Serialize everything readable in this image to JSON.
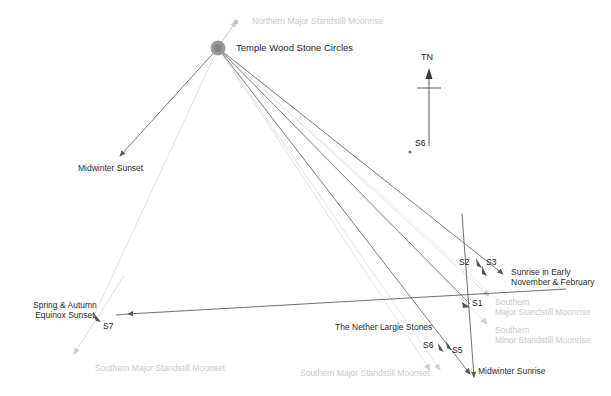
{
  "diagram": {
    "background_color": "#ffffff",
    "width": 611,
    "height": 396,
    "colors": {
      "ray_dark": "#6b6b6b",
      "ray_mid": "#8f8f8f",
      "ray_faint": "#dedede",
      "text_dark": "#2b2b2b",
      "text_faint": "#c9c9c9",
      "marker": "#8c8c8c"
    }
  },
  "origin": {
    "name": "Temple Wood Stone Circles",
    "label": "Temple Wood Stone Circles",
    "x": 218,
    "y": 48,
    "marker": "filled-circle"
  },
  "north_indicator": {
    "label": "TN",
    "x": 428,
    "y": 58,
    "shaft_top": 72,
    "shaft_bottom": 145,
    "crossbar_y": 88
  },
  "labels": [
    {
      "id": "northern-major-standstill-moonrise",
      "text": "Northern Major Standstill Moonrise",
      "x": 252,
      "y": 22,
      "tone": "faint",
      "align": "left"
    },
    {
      "id": "temple-wood-stone-circles",
      "text": "Temple Wood Stone Circles",
      "x": 236,
      "y": 43,
      "tone": "stone",
      "align": "left"
    },
    {
      "id": "midwinter-sunset",
      "text": "Midwinter Sunset",
      "x": 78,
      "y": 163,
      "tone": "dark",
      "align": "left"
    },
    {
      "id": "spring-autumn-equinox-sunset",
      "text": "Spring & Autumn\nEquinox Sunset",
      "x": 33,
      "y": 302,
      "tone": "dark",
      "align": "left"
    },
    {
      "id": "the-nether-largie-stones",
      "text": "The Nether Largie Stones",
      "x": 335,
      "y": 325,
      "tone": "dark",
      "align": "left"
    },
    {
      "id": "sunrise-early-november-february",
      "text": "Sunrise in Early\nNovember & February",
      "x": 511,
      "y": 269,
      "tone": "dark",
      "align": "left"
    },
    {
      "id": "southern-major-standstill-moonrise",
      "text": "Southern\nMajor Standstill Moonrise",
      "x": 491,
      "y": 299,
      "tone": "faint",
      "align": "left"
    },
    {
      "id": "southern-minor-standstill-moonrise",
      "text": "Southern\nMinor Standstill Moonrise",
      "x": 491,
      "y": 326,
      "tone": "faint",
      "align": "left"
    },
    {
      "id": "midwinter-sunrise",
      "text": "Midwinter Sunrise",
      "x": 478,
      "y": 367,
      "tone": "dark",
      "align": "left"
    },
    {
      "id": "southern-major-standstill-moonset-left",
      "text": "Southern Major Standstill Moonset",
      "x": 95,
      "y": 364,
      "tone": "faint",
      "align": "left"
    },
    {
      "id": "southern-major-standstill-moonset-mid",
      "text": "Southern Major Standstill Moonset",
      "x": 300,
      "y": 369,
      "tone": "faint",
      "align": "left"
    }
  ],
  "stone_markers": [
    {
      "id": "S7",
      "label": "S7",
      "label_x": 103,
      "label_y": 325,
      "dot_x": 97,
      "dot_y": 317
    },
    {
      "id": "S1",
      "label": "S1",
      "label_x": 472,
      "label_y": 300,
      "dot_x": 466,
      "dot_y": 305
    },
    {
      "id": "S2",
      "label": "S2",
      "label_x": 461,
      "label_y": 260,
      "dot_x": 478,
      "dot_y": 261
    },
    {
      "id": "S3",
      "label": "S3",
      "label_x": 486,
      "label_y": 260,
      "dot_x": 483,
      "dot_y": 268
    },
    {
      "id": "S5",
      "label": "S5",
      "label_x": 452,
      "label_y": 347,
      "dot_x": 447,
      "dot_y": 344
    },
    {
      "id": "S6-bottom",
      "label": "S6",
      "label_x": 425,
      "label_y": 342,
      "dot_x": 440,
      "dot_y": 346
    },
    {
      "id": "S6-north",
      "label": "S6",
      "label_x": 417,
      "label_y": 139,
      "dot_x": 411,
      "dot_y": 151
    }
  ],
  "rays": [
    {
      "id": "ray-midwinter-sunset",
      "from": "origin",
      "to_x": 118,
      "to_y": 158,
      "tone": "dark",
      "arrow": true
    },
    {
      "id": "ray-equinox-sunset-via-s7",
      "from": "origin",
      "to_x": 88,
      "to_y": 330,
      "tone": "faint",
      "arrow": true
    },
    {
      "id": "ray-s1-axis",
      "from": "origin",
      "to_x": 472,
      "to_y": 307,
      "tone": "dark",
      "arrow": true
    },
    {
      "id": "ray-sunrise-nov-feb",
      "from": "origin",
      "to_x": 504,
      "to_y": 276,
      "tone": "dark",
      "arrow": true
    },
    {
      "id": "ray-midwinter-sunrise",
      "from": "origin",
      "to_x": 474,
      "to_y": 378,
      "tone": "dark",
      "arrow": true
    },
    {
      "id": "ray-southern-major-moonrise",
      "from": "origin",
      "to_x": 489,
      "to_y": 296,
      "tone": "faint",
      "arrow": true
    },
    {
      "id": "ray-southern-minor-moonrise",
      "from": "origin",
      "to_x": 487,
      "to_y": 324,
      "tone": "faint",
      "arrow": true
    },
    {
      "id": "ray-southern-major-moonset-a",
      "from": "origin",
      "to_x": 431,
      "to_y": 372,
      "tone": "faint",
      "arrow": true
    },
    {
      "id": "ray-southern-major-moonset-b",
      "from": "origin",
      "to_x": 438,
      "to_y": 372,
      "tone": "faint",
      "arrow": true
    },
    {
      "id": "ray-northern-major-moonrise",
      "from": "origin",
      "to_x": 236,
      "to_y": 20,
      "tone": "faint",
      "arrow": true
    },
    {
      "id": "ray-nether-largie-baseline",
      "from_x": 565,
      "from_y": 290,
      "to_x": 126,
      "to_y": 315,
      "tone": "dark",
      "arrow": true
    },
    {
      "id": "ray-s7-moonset-diagonal",
      "from_x": 122,
      "from_y": 280,
      "to_x": 72,
      "to_y": 356,
      "tone": "faint",
      "arrow": true
    },
    {
      "id": "ray-s3-s5-diagonal",
      "from_x": 466,
      "from_y": 219,
      "to_x": 472,
      "to_y": 378,
      "tone": "dark",
      "arrow": true
    }
  ]
}
